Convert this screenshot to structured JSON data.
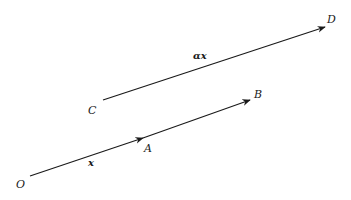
{
  "diagram": {
    "type": "vector-diagram",
    "stroke_color": "#1a1a1a",
    "background": "#ffffff",
    "points": {
      "O": {
        "label": "O",
        "x": 20,
        "y": 187
      },
      "A": {
        "label": "A",
        "x": 146,
        "y": 151
      },
      "B": {
        "label": "B",
        "x": 255,
        "y": 98
      },
      "C": {
        "label": "C",
        "x": 89,
        "y": 113
      },
      "D": {
        "label": "D",
        "x": 328,
        "y": 22
      }
    },
    "vectors": [
      {
        "id": "OA",
        "from": "O",
        "to": "A",
        "label": "x",
        "x1": 30,
        "y1": 176,
        "x2": 143,
        "y2": 138
      },
      {
        "id": "AB",
        "from": "A",
        "to": "B",
        "label": "",
        "x1": 143,
        "y1": 138,
        "x2": 250,
        "y2": 100
      },
      {
        "id": "CD",
        "from": "C",
        "to": "D",
        "label": "αx",
        "x1": 103,
        "y1": 100,
        "x2": 325,
        "y2": 27
      }
    ],
    "vector_labels": {
      "x": {
        "text": "x",
        "x": 89,
        "y": 166
      },
      "alpha_x": {
        "text": "αx",
        "x": 194,
        "y": 59
      }
    }
  }
}
